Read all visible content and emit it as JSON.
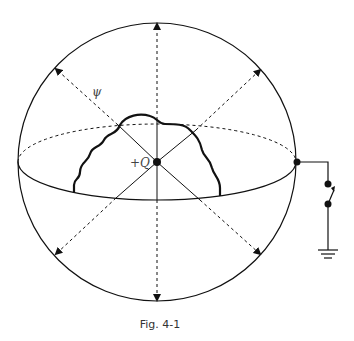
{
  "figure": {
    "caption": "Fig. 4-1",
    "flux_label": "ψ",
    "charge_label": "+Q",
    "colors": {
      "stroke": "#111111",
      "background": "#ffffff"
    },
    "elements": {
      "outer_sphere": "circle",
      "equator": "ellipse (front solid, back dashed)",
      "inner_conductor": "wavy closed surface around charge",
      "flux_lines": 8,
      "switch": "open switch to ground",
      "ground": "ground symbol"
    }
  }
}
